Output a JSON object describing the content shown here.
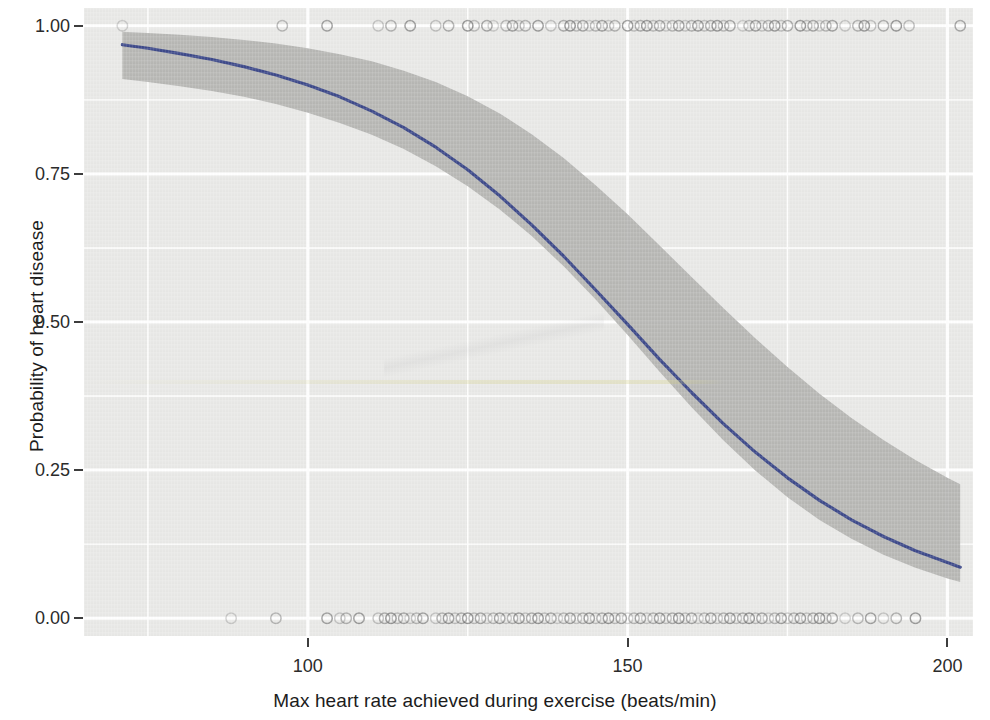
{
  "chart_data": {
    "type": "line",
    "title": "",
    "xlabel": "Max heart rate achieved during exercise (beats/min)",
    "ylabel": "Probability of heart disease",
    "xlim": [
      65,
      204
    ],
    "ylim": [
      -0.03,
      1.03
    ],
    "xticks": [
      100,
      150,
      200
    ],
    "xtick_labels": [
      "100",
      "150",
      "200"
    ],
    "yticks": [
      0.0,
      0.25,
      0.5,
      0.75,
      1.0
    ],
    "ytick_labels": [
      "0.00",
      "0.25",
      "0.50",
      "0.75",
      "1.00"
    ],
    "grid": true,
    "legend": null,
    "series": [
      {
        "name": "Predicted probability",
        "type": "line",
        "color": "#3e4a8a",
        "x": [
          71,
          75,
          80,
          85,
          90,
          95,
          100,
          105,
          110,
          115,
          120,
          125,
          130,
          135,
          140,
          145,
          150,
          155,
          160,
          165,
          170,
          175,
          180,
          185,
          190,
          195,
          200,
          202
        ],
        "y": [
          0.968,
          0.962,
          0.953,
          0.943,
          0.931,
          0.917,
          0.9,
          0.88,
          0.856,
          0.828,
          0.795,
          0.757,
          0.713,
          0.664,
          0.611,
          0.554,
          0.496,
          0.437,
          0.381,
          0.328,
          0.28,
          0.237,
          0.199,
          0.166,
          0.138,
          0.114,
          0.094,
          0.086
        ]
      },
      {
        "name": "95% confidence interval",
        "type": "ribbon",
        "color": "#b3b3b1",
        "x": [
          71,
          75,
          80,
          85,
          90,
          95,
          100,
          105,
          110,
          115,
          120,
          125,
          130,
          135,
          140,
          145,
          150,
          155,
          160,
          165,
          170,
          175,
          180,
          185,
          190,
          195,
          200,
          202
        ],
        "ylow": [
          0.91,
          0.905,
          0.898,
          0.89,
          0.88,
          0.868,
          0.853,
          0.836,
          0.816,
          0.792,
          0.763,
          0.729,
          0.69,
          0.645,
          0.594,
          0.538,
          0.478,
          0.416,
          0.356,
          0.3,
          0.249,
          0.204,
          0.166,
          0.134,
          0.107,
          0.085,
          0.067,
          0.061
        ],
        "yhigh": [
          0.99,
          0.988,
          0.985,
          0.981,
          0.976,
          0.97,
          0.962,
          0.952,
          0.94,
          0.924,
          0.905,
          0.881,
          0.852,
          0.817,
          0.777,
          0.731,
          0.682,
          0.629,
          0.576,
          0.523,
          0.472,
          0.424,
          0.379,
          0.338,
          0.301,
          0.267,
          0.237,
          0.226
        ]
      },
      {
        "name": "Observed cases (heart disease = 1)",
        "type": "scatter",
        "y_value": 1.0,
        "marker": "open-circle",
        "x": [
          71,
          96,
          103,
          111,
          113,
          116,
          120,
          122,
          125,
          126,
          128,
          129,
          131,
          132,
          133,
          134,
          136,
          138,
          140,
          141,
          142,
          143,
          144,
          145,
          146,
          147,
          148,
          150,
          151,
          152,
          153,
          154,
          155,
          156,
          157,
          158,
          159,
          160,
          161,
          162,
          163,
          164,
          165,
          166,
          168,
          169,
          170,
          171,
          172,
          173,
          174,
          175,
          177,
          178,
          179,
          180,
          181,
          182,
          184,
          186,
          187,
          188,
          190,
          192,
          194,
          202
        ]
      },
      {
        "name": "Observed cases (heart disease = 0)",
        "type": "scatter",
        "y_value": 0.0,
        "marker": "open-circle",
        "x": [
          88,
          95,
          103,
          105,
          106,
          108,
          111,
          112,
          113,
          114,
          115,
          116,
          117,
          118,
          120,
          121,
          122,
          123,
          124,
          125,
          126,
          127,
          128,
          129,
          130,
          131,
          132,
          133,
          134,
          135,
          136,
          137,
          138,
          139,
          140,
          141,
          142,
          143,
          144,
          145,
          146,
          147,
          148,
          149,
          150,
          151,
          152,
          153,
          154,
          155,
          156,
          157,
          158,
          159,
          160,
          161,
          162,
          163,
          164,
          165,
          166,
          167,
          168,
          169,
          170,
          171,
          172,
          173,
          174,
          175,
          176,
          177,
          178,
          179,
          180,
          181,
          182,
          184,
          186,
          188,
          190,
          192,
          195
        ]
      }
    ]
  },
  "axis": {
    "x_title": "Max heart rate achieved during exercise (beats/min)",
    "y_title": "Probability of heart disease"
  },
  "style": {
    "panel_background": "#e9e9e7",
    "gridline_color": "#ffffff",
    "line_color": "#3e4a8a",
    "ribbon_color": "#b3b3b1",
    "point_color": "#6f6f6f",
    "text_color": "#1c1c1c"
  }
}
